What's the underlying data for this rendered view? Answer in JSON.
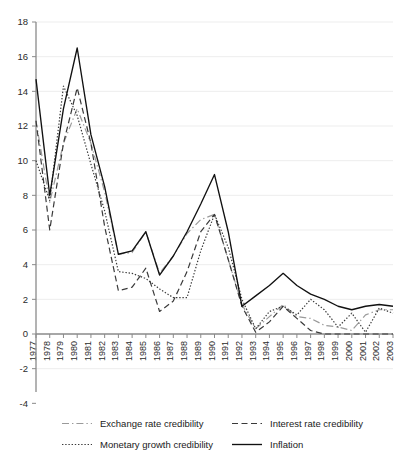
{
  "chart_data": {
    "type": "line",
    "title": "",
    "subtitle": "",
    "xlabel": "",
    "ylabel": "",
    "x": [
      1977,
      1978,
      1979,
      1980,
      1981,
      1982,
      1983,
      1984,
      1985,
      1986,
      1987,
      1988,
      1989,
      1990,
      1991,
      1992,
      1993,
      1994,
      1995,
      1996,
      1997,
      1998,
      1999,
      2000,
      2001,
      2002,
      2003
    ],
    "xtick_labels": [
      "1977",
      "1978",
      "1979",
      "1980",
      "1981",
      "1982",
      "1983",
      "1984",
      "1985",
      "1986",
      "1987",
      "1988",
      "1989",
      "1990",
      "1991",
      "1992",
      "1993",
      "1994",
      "1995",
      "1996",
      "1997",
      "1998",
      "1999",
      "2000",
      "2001",
      "2002",
      "2003"
    ],
    "ytick_labels": [
      "18",
      "16",
      "14",
      "12",
      "10",
      "8",
      "6",
      "4",
      "2",
      "0",
      "-2",
      "-4"
    ],
    "yticks": [
      18,
      16,
      14,
      12,
      10,
      8,
      6,
      4,
      2,
      0,
      -2,
      -4
    ],
    "ylim": [
      -4,
      18
    ],
    "xlim": [
      1977,
      2003
    ],
    "grid": true,
    "grid_axis": "y",
    "legend_position": "bottom",
    "series": [
      {
        "name": "Exchange rate credibility",
        "style": "dash-dot",
        "color": "#9a9a9a",
        "values": [
          12.3,
          7.6,
          11.0,
          13.0,
          11.0,
          8.2,
          4.6,
          4.7,
          5.9,
          3.5,
          4.5,
          5.8,
          6.6,
          6.9,
          4.3,
          1.7,
          0.3,
          1.0,
          1.7,
          1.0,
          0.9,
          0.5,
          0.4,
          0.2,
          1.1,
          1.4,
          1.4
        ]
      },
      {
        "name": "Interest rate credibility",
        "style": "dashed",
        "color": "#3a3a3a",
        "values": [
          12.3,
          6.0,
          11.0,
          14.2,
          11.0,
          6.2,
          2.5,
          2.7,
          3.8,
          1.3,
          1.9,
          3.6,
          5.9,
          6.9,
          4.3,
          1.6,
          0.1,
          0.7,
          1.6,
          0.9,
          0.2,
          0.0,
          0.0,
          0.0,
          0.0,
          0.0,
          0.0
        ]
      },
      {
        "name": "Monetary growth credibility",
        "style": "dotted",
        "color": "#3a3a3a",
        "values": [
          10.0,
          7.7,
          14.3,
          12.6,
          9.8,
          7.1,
          3.6,
          3.5,
          3.2,
          2.6,
          2.1,
          2.1,
          4.8,
          6.9,
          5.0,
          2.0,
          0.3,
          1.3,
          1.6,
          1.1,
          2.0,
          1.4,
          0.4,
          1.2,
          0.1,
          1.5,
          1.2
        ]
      },
      {
        "name": "Inflation",
        "style": "solid",
        "color": "#111111",
        "values": [
          14.7,
          8.0,
          13.0,
          16.5,
          11.5,
          8.5,
          4.6,
          4.8,
          5.9,
          3.4,
          4.5,
          5.9,
          7.5,
          9.2,
          5.9,
          1.6,
          2.2,
          2.8,
          3.5,
          2.8,
          2.3,
          2.0,
          1.6,
          1.4,
          1.6,
          1.7,
          1.6
        ]
      }
    ]
  },
  "legend": {
    "items": [
      {
        "label": "Exchange rate credibility",
        "swatch": "dash-dot-swatch"
      },
      {
        "label": "Interest rate credibility",
        "swatch": "dashed-swatch"
      },
      {
        "label": "Monetary growth credibility",
        "swatch": "dotted-swatch"
      },
      {
        "label": "Inflation",
        "swatch": "solid-swatch"
      }
    ]
  }
}
